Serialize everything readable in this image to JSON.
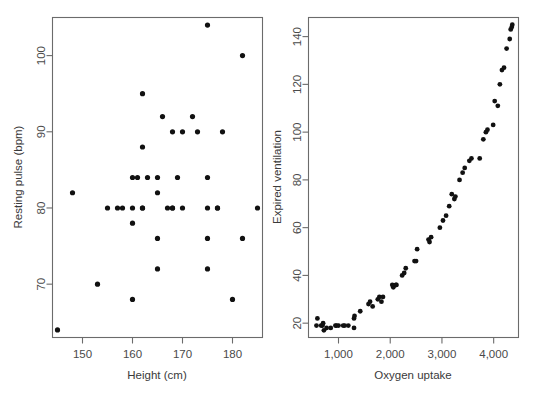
{
  "figure": {
    "background_color": "#ffffff",
    "point_color": "#111111",
    "axis_color": "#6b6b6b",
    "text_color": "#3a3a3a"
  },
  "chart_data": [
    {
      "type": "scatter",
      "panel": "left",
      "title": "",
      "xlabel": "Height (cm)",
      "ylabel": "Resting pulse (bpm)",
      "xlim": [
        144,
        186
      ],
      "ylim": [
        63,
        105
      ],
      "xticks": [
        150,
        160,
        170,
        180
      ],
      "xtick_labels": [
        "150",
        "160",
        "170",
        "180"
      ],
      "yticks": [
        70,
        80,
        90,
        100
      ],
      "ytick_labels": [
        "70",
        "80",
        "90",
        "100"
      ],
      "grid": false,
      "legend": "none",
      "x": [
        145,
        148,
        153,
        155,
        157,
        158,
        160,
        160,
        160,
        160,
        161,
        162,
        162,
        162,
        162,
        163,
        165,
        165,
        165,
        165,
        166,
        167,
        168,
        168,
        168,
        169,
        170,
        170,
        172,
        173,
        175,
        175,
        175,
        175,
        175,
        177,
        177,
        178,
        180,
        182,
        182,
        185
      ],
      "y": [
        64,
        82,
        70,
        80,
        80,
        80,
        68,
        78,
        80,
        84,
        84,
        80,
        80,
        88,
        95,
        84,
        72,
        76,
        82,
        84,
        92,
        80,
        80,
        80,
        90,
        84,
        80,
        90,
        92,
        90,
        72,
        76,
        80,
        84,
        104,
        80,
        80,
        90,
        68,
        76,
        100,
        80
      ]
    },
    {
      "type": "scatter",
      "panel": "right",
      "title": "",
      "xlabel": "Oxygen uptake",
      "ylabel": "Expired ventilation",
      "xlim": [
        420,
        4480
      ],
      "ylim": [
        14,
        148
      ],
      "xticks": [
        1000,
        2000,
        3000,
        4000
      ],
      "xtick_labels": [
        "1,000",
        "2,000",
        "3,000",
        "4,000"
      ],
      "yticks": [
        20,
        40,
        60,
        80,
        100,
        120,
        140
      ],
      "ytick_labels": [
        "20",
        "40",
        "60",
        "80",
        "100",
        "120",
        "140"
      ],
      "grid": false,
      "legend": "none",
      "x": [
        574,
        592,
        664,
        690,
        702,
        718,
        770,
        850,
        940,
        960,
        1000,
        1090,
        1120,
        1190,
        1300,
        1300,
        1310,
        1420,
        1580,
        1610,
        1660,
        1760,
        1790,
        1830,
        1860,
        2040,
        2060,
        2110,
        2120,
        2230,
        2270,
        2300,
        2470,
        2500,
        2520,
        2740,
        2760,
        2790,
        2960,
        3020,
        3080,
        3140,
        3190,
        3240,
        3260,
        3340,
        3400,
        3440,
        3530,
        3570,
        3730,
        3800,
        3850,
        3880,
        3990,
        4020,
        4080,
        4120,
        4160,
        4200,
        4250,
        4310,
        4330,
        4350,
        4360
      ],
      "y": [
        19,
        22,
        19,
        19,
        20,
        17,
        18,
        18,
        19,
        19,
        19,
        19,
        19,
        19,
        18,
        22,
        23,
        25,
        28,
        29,
        27,
        30,
        31,
        29,
        31,
        36,
        35,
        36,
        36,
        40,
        41,
        43,
        46,
        46,
        51,
        55,
        54,
        56,
        60,
        63,
        65,
        69,
        74,
        72,
        73,
        80,
        83,
        85,
        88,
        89,
        89,
        97,
        100,
        101,
        103,
        113,
        111,
        120,
        126,
        127,
        135,
        139,
        143,
        144,
        145
      ]
    }
  ]
}
